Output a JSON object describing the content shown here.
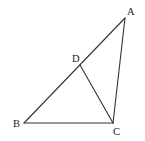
{
  "diagram": {
    "type": "geometry-triangle",
    "stroke_color": "#333333",
    "label_color": "#222222",
    "points": {
      "A": {
        "x": 125,
        "y": 18
      },
      "B": {
        "x": 24,
        "y": 123
      },
      "C": {
        "x": 113,
        "y": 123
      },
      "D": {
        "x": 80,
        "y": 65
      }
    },
    "labels": {
      "A": {
        "text": "A",
        "x": 127,
        "y": 15
      },
      "B": {
        "text": "B",
        "x": 13,
        "y": 127
      },
      "C": {
        "text": "C",
        "x": 113,
        "y": 135
      },
      "D": {
        "text": "D",
        "x": 72,
        "y": 62
      }
    },
    "segments": [
      {
        "from": "A",
        "to": "B",
        "name": "segment-ab"
      },
      {
        "from": "B",
        "to": "C",
        "name": "segment-bc"
      },
      {
        "from": "C",
        "to": "A",
        "name": "segment-ca"
      },
      {
        "from": "D",
        "to": "C",
        "name": "segment-dc"
      }
    ]
  }
}
